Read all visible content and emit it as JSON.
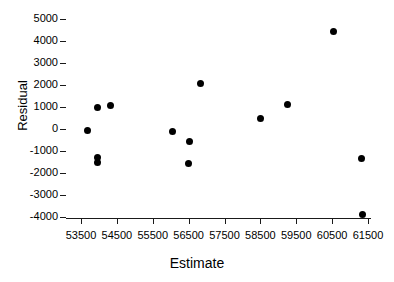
{
  "chart_data": {
    "type": "scatter",
    "title": "",
    "xlabel": "Estimate",
    "ylabel": "Residual",
    "xlim": [
      53000,
      61900
    ],
    "ylim": [
      -4000,
      5000
    ],
    "grid": false,
    "legend": null,
    "xticks": [
      53500,
      54500,
      55500,
      56500,
      57500,
      58500,
      59500,
      60500,
      61500
    ],
    "xtick_labels": [
      "53500",
      "54500",
      "55500",
      "56500",
      "57500",
      "58500",
      "59500",
      "60500",
      "61500"
    ],
    "yticks": [
      5000,
      4000,
      3000,
      2000,
      1000,
      0,
      -1000,
      -2000,
      -3000,
      -4000
    ],
    "ytick_labels": [
      "5000",
      "4000",
      "3000",
      "2000",
      "1000",
      "0",
      "-1000",
      "-2000",
      "-3000",
      "-4000"
    ],
    "series": [
      {
        "name": "residuals",
        "marker": "circle",
        "color": "#000000",
        "points": [
          {
            "x": 53670,
            "y": -50
          },
          {
            "x": 53950,
            "y": 1000
          },
          {
            "x": 54310,
            "y": 1090
          },
          {
            "x": 53950,
            "y": -1300
          },
          {
            "x": 53950,
            "y": -1500
          },
          {
            "x": 56060,
            "y": -100
          },
          {
            "x": 56530,
            "y": -550
          },
          {
            "x": 56490,
            "y": -1580
          },
          {
            "x": 56830,
            "y": 2050
          },
          {
            "x": 58490,
            "y": 460
          },
          {
            "x": 59250,
            "y": 1120
          },
          {
            "x": 60530,
            "y": 4430
          },
          {
            "x": 61310,
            "y": -1360
          },
          {
            "x": 61360,
            "y": -3900
          }
        ]
      }
    ]
  }
}
